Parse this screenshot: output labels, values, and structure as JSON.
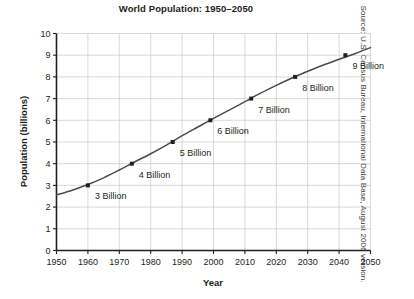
{
  "chart_data": {
    "type": "line",
    "title": "World Population: 1950–2050",
    "xlabel": "Year",
    "ylabel": "Population (billions)",
    "xlim": [
      1950,
      2050
    ],
    "ylim": [
      0,
      10
    ],
    "grid": true,
    "legend": null,
    "x_ticks": [
      "1950",
      "1960",
      "1970",
      "1980",
      "1990",
      "2000",
      "2010",
      "2020",
      "2030",
      "2040",
      "2050"
    ],
    "x_tick_values": [
      1950,
      1960,
      1970,
      1980,
      1990,
      2000,
      2010,
      2020,
      2030,
      2040,
      2050
    ],
    "y_ticks": [
      "0",
      "1",
      "2",
      "3",
      "4",
      "5",
      "6",
      "7",
      "8",
      "9",
      "10"
    ],
    "y_tick_values": [
      0,
      1,
      2,
      3,
      4,
      5,
      6,
      7,
      8,
      9,
      10
    ],
    "series": [
      {
        "name": "World population",
        "x": [
          1950,
          1955,
          1960,
          1965,
          1970,
          1975,
          1980,
          1985,
          1990,
          1995,
          2000,
          2005,
          2010,
          2015,
          2020,
          2025,
          2030,
          2035,
          2040,
          2045,
          2050
        ],
        "values": [
          2.56,
          2.78,
          3.04,
          3.35,
          3.71,
          4.09,
          4.46,
          4.86,
          5.29,
          5.69,
          6.09,
          6.47,
          6.86,
          7.25,
          7.61,
          7.95,
          8.26,
          8.55,
          8.81,
          9.07,
          9.35
        ]
      }
    ],
    "annotations": [
      {
        "label": "3 Billion",
        "x": 1960,
        "y": 3
      },
      {
        "label": "4 Billion",
        "x": 1974,
        "y": 4
      },
      {
        "label": "5 Billion",
        "x": 1987,
        "y": 5
      },
      {
        "label": "6 Billion",
        "x": 1999,
        "y": 6
      },
      {
        "label": "7 Billion",
        "x": 2012,
        "y": 7
      },
      {
        "label": "8 Billion",
        "x": 2026,
        "y": 8
      },
      {
        "label": "9 Billion",
        "x": 2042,
        "y": 9
      }
    ],
    "markers": [
      {
        "x": 1960,
        "y": 3
      },
      {
        "x": 1974,
        "y": 4
      },
      {
        "x": 1987,
        "y": 5
      },
      {
        "x": 1999,
        "y": 6
      },
      {
        "x": 2012,
        "y": 7
      },
      {
        "x": 2026,
        "y": 8
      },
      {
        "x": 2042,
        "y": 9
      }
    ],
    "colors": {
      "curve": "#4a4a52",
      "marker": "#231f20",
      "grid": "#c9c9cd",
      "axis": "#231f20",
      "text": "#231f20",
      "background": "#ffffff"
    }
  },
  "source": {
    "note": "Source: U.S. Census Bureau, International Data Base, August 2006 version."
  }
}
